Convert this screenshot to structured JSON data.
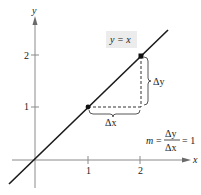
{
  "figure": {
    "axes": {
      "x_label": "x",
      "y_label": "y",
      "x_ticks": [
        "1",
        "2"
      ],
      "y_ticks": [
        "1",
        "2"
      ]
    },
    "line": {
      "equation_label": "y = x"
    },
    "points": [
      {
        "x": 1,
        "y": 1
      },
      {
        "x": 2,
        "y": 2
      }
    ],
    "annotations": {
      "delta_x": "Δx",
      "delta_y": "Δy",
      "slope_m": "m",
      "equals": "=",
      "fraction_num": "Δy",
      "fraction_den": "Δx",
      "slope_value": "= 1"
    },
    "colors": {
      "axis": "#8a8a8a",
      "line": "#1a1a1a",
      "label_box": "#ececec"
    }
  }
}
